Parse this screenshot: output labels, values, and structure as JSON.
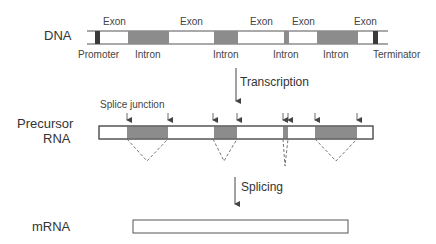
{
  "rows": {
    "dna": {
      "label": "DNA"
    },
    "precursor": {
      "label_line1": "Precursor",
      "label_line2": "RNA"
    },
    "mrna": {
      "label": "mRNA"
    }
  },
  "dna_labels": {
    "exons": [
      "Exon",
      "Exon",
      "Exon",
      "Exon",
      "Exon"
    ],
    "introns": [
      "Intron",
      "Intron",
      "Intron",
      "Intron"
    ],
    "promoter": "Promoter",
    "terminator": "Terminator"
  },
  "steps": {
    "transcription": "Transcription",
    "splicing": "Splicing"
  },
  "annotations": {
    "splice_junction": "Splice junction"
  },
  "colors": {
    "intron_fill": "#8c8c8c",
    "exon_fill": "#ffffff",
    "promoter_terminator_fill": "#3a3a3a",
    "stroke": "#555555"
  }
}
